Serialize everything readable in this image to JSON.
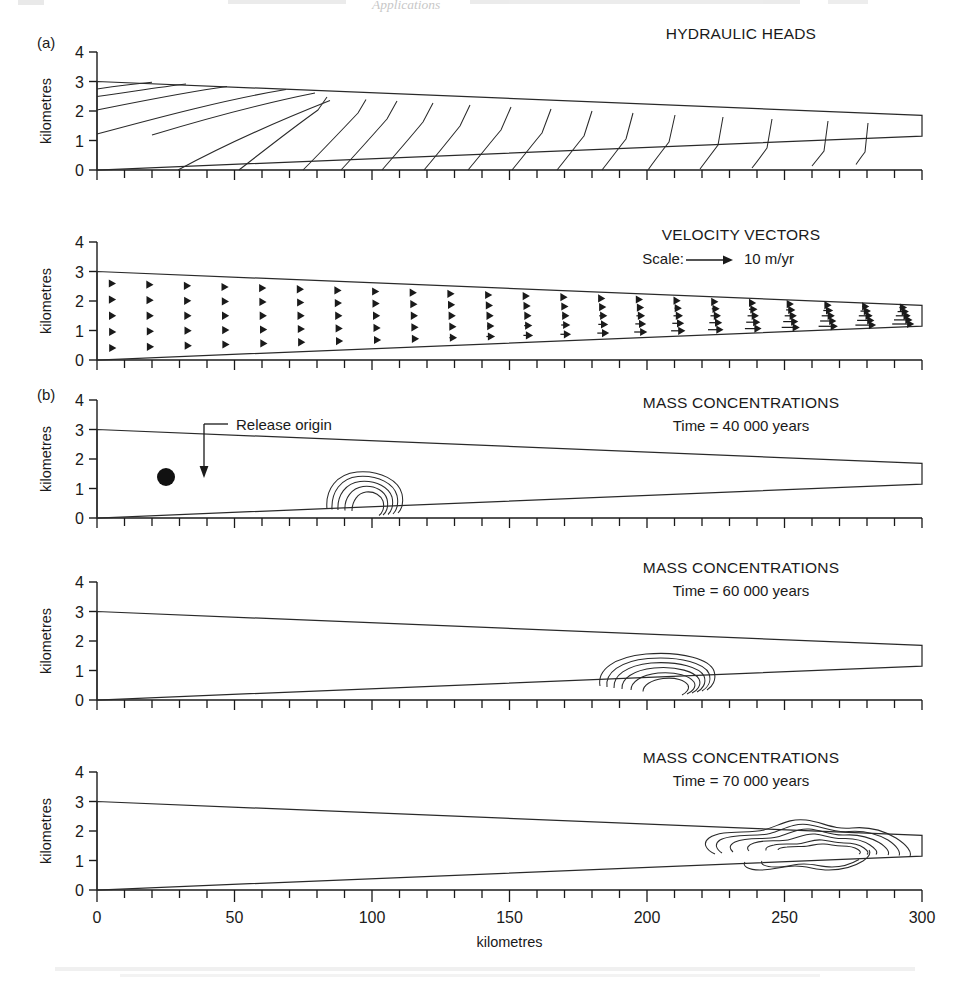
{
  "figure": {
    "panel_a_letter": "(a)",
    "panel_b_letter": "(b)",
    "axis_y_label": "kilometres",
    "axis_x_label": "kilometres"
  },
  "panels": {
    "hydraulic_heads": {
      "title": "HYDRAULIC HEADS",
      "y_ticks": [
        "0",
        "1",
        "2",
        "3",
        "4"
      ]
    },
    "velocity_vectors": {
      "title": "VELOCITY VECTORS",
      "scale_label": "Scale:",
      "scale_value": "10 m/yr",
      "y_ticks": [
        "0",
        "1",
        "2",
        "3",
        "4"
      ]
    },
    "mass_40k": {
      "title": "MASS CONCENTRATIONS",
      "subtitle": "Time = 40 000 years",
      "annotation": "Release origin",
      "y_ticks": [
        "0",
        "1",
        "2",
        "3",
        "4"
      ]
    },
    "mass_60k": {
      "title": "MASS CONCENTRATIONS",
      "subtitle": "Time = 60 000 years",
      "y_ticks": [
        "0",
        "1",
        "2",
        "3",
        "4"
      ]
    },
    "mass_70k": {
      "title": "MASS CONCENTRATIONS",
      "subtitle": "Time = 70 000 years",
      "y_ticks": [
        "0",
        "1",
        "2",
        "3",
        "4"
      ]
    }
  },
  "x_axis": {
    "ticks": [
      "0",
      "50",
      "100",
      "150",
      "200",
      "250",
      "300"
    ],
    "label": "kilometres",
    "min": 0,
    "max": 300,
    "minor_step": 10
  },
  "chart_data": {
    "type": "line",
    "xlabel": "kilometres",
    "ylabel": "kilometres",
    "xlim": [
      0,
      300
    ],
    "ylim": [
      0,
      4
    ],
    "grid": false,
    "legend_position": "none",
    "domain_geometry": {
      "description": "Wedge-shaped aquifer cross-section; top surface slopes from 3.0 km at x=0 down to 1.85 km at x=300; base rises from 0.0 km at x=0 to 1.15 km at x=300",
      "top_left_y": 3.0,
      "top_right_y": 1.85,
      "base_left_y": 0.0,
      "base_right_y": 1.15
    },
    "panels": [
      {
        "name": "hydraulic_heads",
        "type": "contour",
        "title": "HYDRAULIC HEADS",
        "contour_count": 17,
        "description": "Equipotential lines, curved and fanning near the thick left end, becoming nearly V-shaped/chevron and evenly spaced downgradient toward the thin right end"
      },
      {
        "name": "velocity_vectors",
        "type": "quiver",
        "title": "VELOCITY VECTORS",
        "scale_arrow_value": 10,
        "scale_arrow_units": "m/yr",
        "rows": 5,
        "columns": 22,
        "description": "Darcy velocity arrows all directed to the right; magnitude increases with distance downgradient and is greatest along the lower half of the narrowing wedge"
      },
      {
        "name": "mass_concentrations_40000",
        "type": "contour",
        "title": "MASS CONCENTRATIONS",
        "time_years": 40000,
        "plume_center_x": 103,
        "plume_center_y": 0.85,
        "plume_x_range": [
          84,
          125
        ],
        "plume_peak_y": 1.45,
        "contour_levels": 5,
        "release_origin": {
          "x": 27,
          "y": 1.4,
          "label": "Release origin"
        }
      },
      {
        "name": "mass_concentrations_60000",
        "type": "contour",
        "title": "MASS CONCENTRATIONS",
        "time_years": 60000,
        "plume_center_x": 212,
        "plume_center_y": 0.95,
        "plume_x_range": [
          183,
          245
        ],
        "plume_peak_y": 1.5,
        "contour_levels": 5
      },
      {
        "name": "mass_concentrations_70000",
        "type": "contour",
        "title": "MASS CONCENTRATIONS",
        "time_years": 70000,
        "plume_center_x": 262,
        "plume_center_y": 1.45,
        "plume_x_range": [
          224,
          300
        ],
        "plume_peak_y": 2.0,
        "contour_levels": 6,
        "description": "Elongated, irregular multi-lobed plume occupying the downgradient third of the aquifer and reaching the outflow boundary"
      }
    ]
  }
}
